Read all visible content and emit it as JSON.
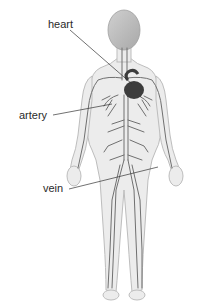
{
  "diagram": {
    "labels": [
      {
        "id": "heart",
        "text": "heart"
      },
      {
        "id": "artery",
        "text": "artery"
      },
      {
        "id": "vein",
        "text": "vein"
      }
    ],
    "colors": {
      "body": "#e6e6e6",
      "outline": "#b5b5b5",
      "vessel": "#6e6e6e",
      "heart": "#3c3c3c",
      "head": "#bdbdbd",
      "leader": "#333333"
    }
  }
}
